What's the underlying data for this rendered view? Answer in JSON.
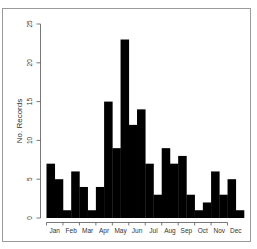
{
  "chart_data": {
    "type": "bar",
    "title": "",
    "xlabel": "",
    "ylabel": "No. Records",
    "ylim": [
      0,
      25
    ],
    "yticks": [
      0,
      5,
      10,
      15,
      20,
      25
    ],
    "xtick_labels": [
      "Jan",
      "Feb",
      "Mar",
      "Apr",
      "May",
      "Jun",
      "Jul",
      "Aug",
      "Sep",
      "Oct",
      "Nov",
      "Dec"
    ],
    "categories": [
      "Jan-1",
      "Jan-2",
      "Feb-1",
      "Feb-2",
      "Mar-1",
      "Mar-2",
      "Apr-1",
      "Apr-2",
      "May-1",
      "May-2",
      "Jun-1",
      "Jun-2",
      "Jul-1",
      "Jul-2",
      "Aug-1",
      "Aug-2",
      "Sep-1",
      "Sep-2",
      "Oct-1",
      "Oct-2",
      "Nov-1",
      "Nov-2",
      "Dec-1",
      "Dec-2"
    ],
    "values": [
      7,
      5,
      1,
      6,
      4,
      1,
      4,
      15,
      9,
      23,
      12,
      14,
      7,
      3,
      9,
      7,
      8,
      3,
      1,
      2,
      6,
      3,
      5,
      1
    ],
    "bar_color": "#000000",
    "grid": false,
    "legend": null
  }
}
